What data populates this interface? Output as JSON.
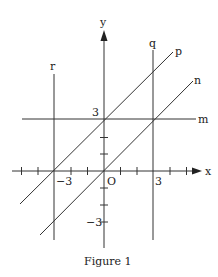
{
  "figure": {
    "caption": "Figure 1",
    "axes": {
      "x_label": "x",
      "y_label": "y",
      "origin_label": "O",
      "tick_labels": {
        "x_neg3": "−3",
        "x_pos3": "3",
        "y_pos3": "3",
        "y_neg3": "−3"
      }
    },
    "lines": {
      "p": {
        "label": "p",
        "description": "y = x + 3"
      },
      "n": {
        "label": "n",
        "description": "y = x"
      },
      "m": {
        "label": "m",
        "description": "y = 3"
      },
      "q": {
        "label": "q",
        "description": "x = 3"
      },
      "r": {
        "label": "r",
        "description": "x = -3"
      }
    }
  }
}
